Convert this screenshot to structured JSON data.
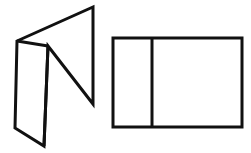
{
  "figure": {
    "background_color": "#ffffff",
    "stroke_color": "#111111",
    "fill_color": "#ffffff",
    "canvas": {
      "width": 251,
      "height": 153
    }
  },
  "shapes": {
    "left": {
      "name": "folded-panel-3d",
      "description": "Two rectangular panels joined along a vertical fold edge, drawn in oblique 3D view",
      "stroke_width": 3,
      "fold_stroke_width": 3,
      "left_panel": {
        "name": "left-panel-face",
        "points": "17,41 48,46 44,146 15,128"
      },
      "back_panel": {
        "name": "back-panel-face",
        "points": "17,41 93,7 93,104 48,46"
      },
      "outline_points": "17,41 93,7 93,104 48,46 44,146 15,128",
      "fold_edge": {
        "x1": 17,
        "y1": 41,
        "x2": 48,
        "y2": 46
      },
      "fold_vertical": {
        "x1": 48,
        "y1": 46,
        "x2": 44,
        "y2": 146
      }
    },
    "right": {
      "name": "flat-net-2d",
      "description": "Unfolded rectangle split by a vertical divider into two faces",
      "stroke_width": 3,
      "divider_stroke_width": 3,
      "rect": {
        "x": 113,
        "y": 38,
        "width": 129,
        "height": 89
      },
      "divider": {
        "x1": 152,
        "y1": 38,
        "x2": 152,
        "y2": 127
      },
      "left_face_points": "113,38 152,38 152,127 113,127",
      "right_face_points": "152,38 242,38 242,127 152,127"
    }
  }
}
